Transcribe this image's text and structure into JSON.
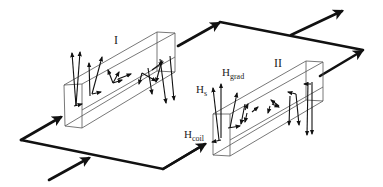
{
  "diagram": {
    "colors": {
      "line": "#111111",
      "box": "#555555",
      "background": "#ffffff"
    },
    "labels": {
      "section_1": "I",
      "section_2": "II",
      "h_s": {
        "main": "H",
        "sub": "s"
      },
      "h_grad": {
        "main": "H",
        "sub": "grad"
      },
      "h_coil": {
        "main": "H",
        "sub": "coil"
      }
    },
    "elements": [
      {
        "type": "box",
        "id": "section-I"
      },
      {
        "type": "box",
        "id": "section-II"
      },
      {
        "type": "path",
        "id": "bottom-current-loop"
      },
      {
        "type": "path",
        "id": "top-current-loop"
      }
    ]
  }
}
